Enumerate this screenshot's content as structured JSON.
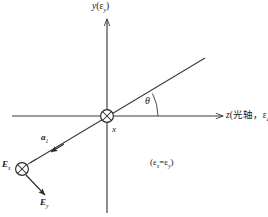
{
  "diagram": {
    "type": "optics-coordinate-diagram",
    "background_color": "#ffffff",
    "stroke_color": "#3a3a3a",
    "text_color": "#1a1a1a",
    "labels": {
      "y_axis": "y(εy)",
      "y_axis_base": "y",
      "y_axis_paren": "(ε",
      "y_axis_sub": "y",
      "y_axis_close": ")",
      "z_axis_base": "z",
      "z_axis_paren": "(光轴，ε",
      "z_axis_sub": "z",
      "z_axis_close": ")",
      "z_axis_full": "z(光轴，εz)",
      "x_center": "x",
      "theta": "θ",
      "a_vector": "a",
      "a_vector_sub": "1",
      "E_x": "E",
      "E_x_sub": "x",
      "E_y": "E",
      "E_y_sub": "y",
      "equation_open": "(ε",
      "equation_sub1": "x",
      "equation_eq": "=ε",
      "equation_sub2": "y",
      "equation_close": ")",
      "equation_full": "(εx=εy)"
    },
    "icons": {
      "origin_marker": "crossed-circle-icon",
      "field_marker": "crossed-circle-icon"
    },
    "geometry": {
      "origin": [
        107,
        116
      ],
      "field_point": [
        22,
        169
      ],
      "theta_degrees": 26,
      "y_axis_top": 18,
      "y_axis_bottom": 213,
      "z_axis_left": 12,
      "z_axis_right": 224,
      "diagonal_start": [
        205,
        58
      ],
      "diagonal_end": [
        30,
        163
      ]
    }
  }
}
